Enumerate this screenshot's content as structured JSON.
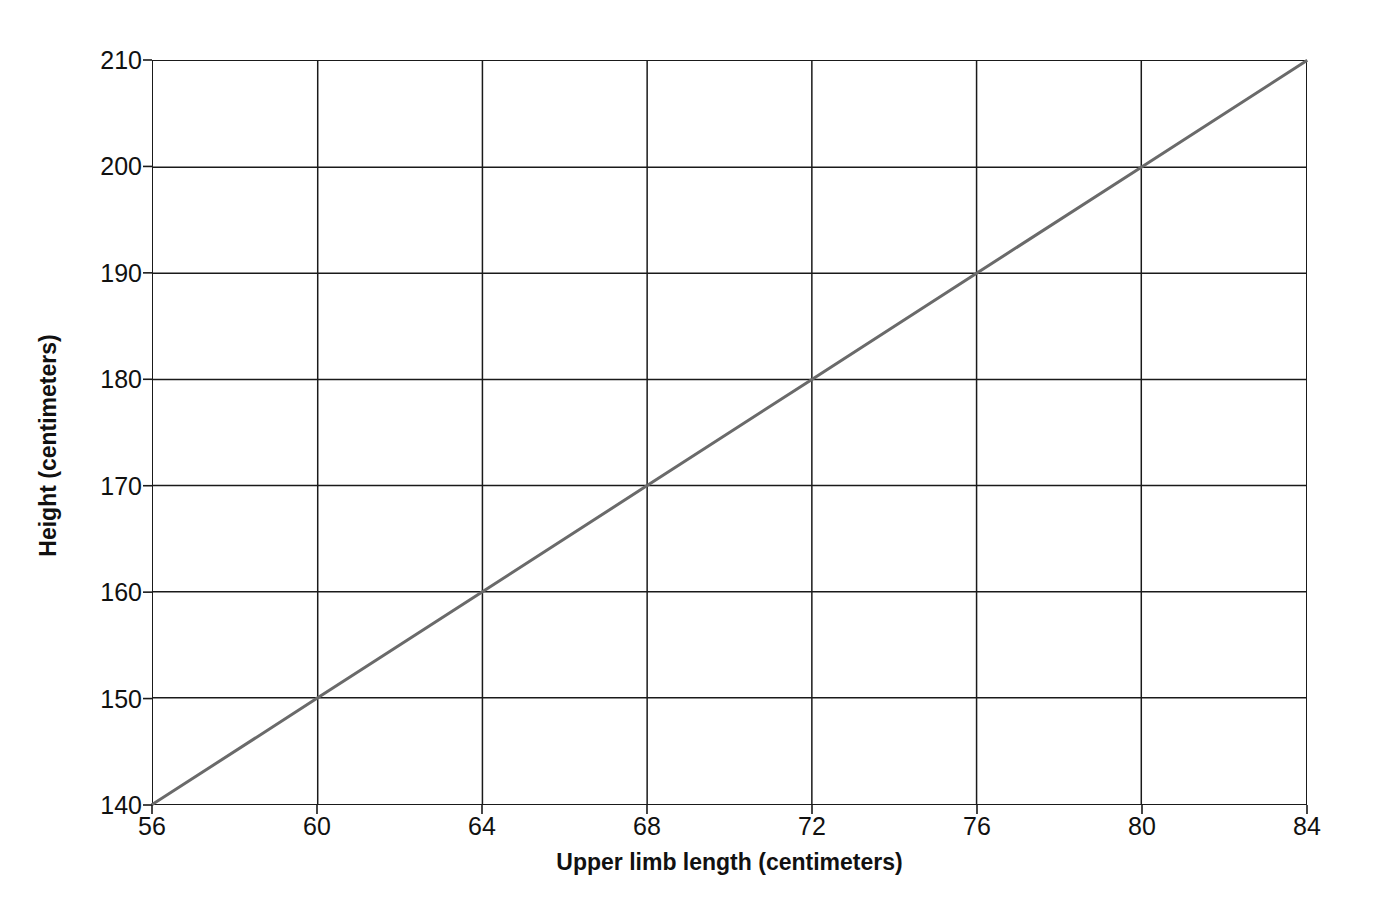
{
  "chart_data": {
    "type": "line",
    "title": "",
    "xlabel": "Upper limb length (centimeters)",
    "ylabel": "Height (centimeters)",
    "xlim": [
      56,
      84
    ],
    "ylim": [
      140,
      210
    ],
    "xticks": [
      56,
      60,
      64,
      68,
      72,
      76,
      80,
      84
    ],
    "yticks": [
      140,
      150,
      160,
      170,
      180,
      190,
      200,
      210
    ],
    "grid": true,
    "legend": "none",
    "series": [
      {
        "name": "Height vs upper limb length",
        "color": "#6a6a6a",
        "x": [
          56,
          60,
          64,
          68,
          72,
          76,
          80,
          84
        ],
        "values": [
          140,
          150,
          160,
          170,
          180,
          190,
          200,
          210
        ]
      }
    ]
  },
  "axes": {
    "x_title": "Upper limb length (centimeters)",
    "y_title": "Height (centimeters)",
    "x_tick_labels": [
      "56",
      "60",
      "64",
      "68",
      "72",
      "76",
      "80",
      "84"
    ],
    "y_tick_labels": [
      "140",
      "150",
      "160",
      "170",
      "180",
      "190",
      "200",
      "210"
    ]
  },
  "colors": {
    "line": "#6a6a6a",
    "grid": "#1a1a1a",
    "frame": "#1a1a1a",
    "background": "#ffffff",
    "text": "#111111"
  }
}
